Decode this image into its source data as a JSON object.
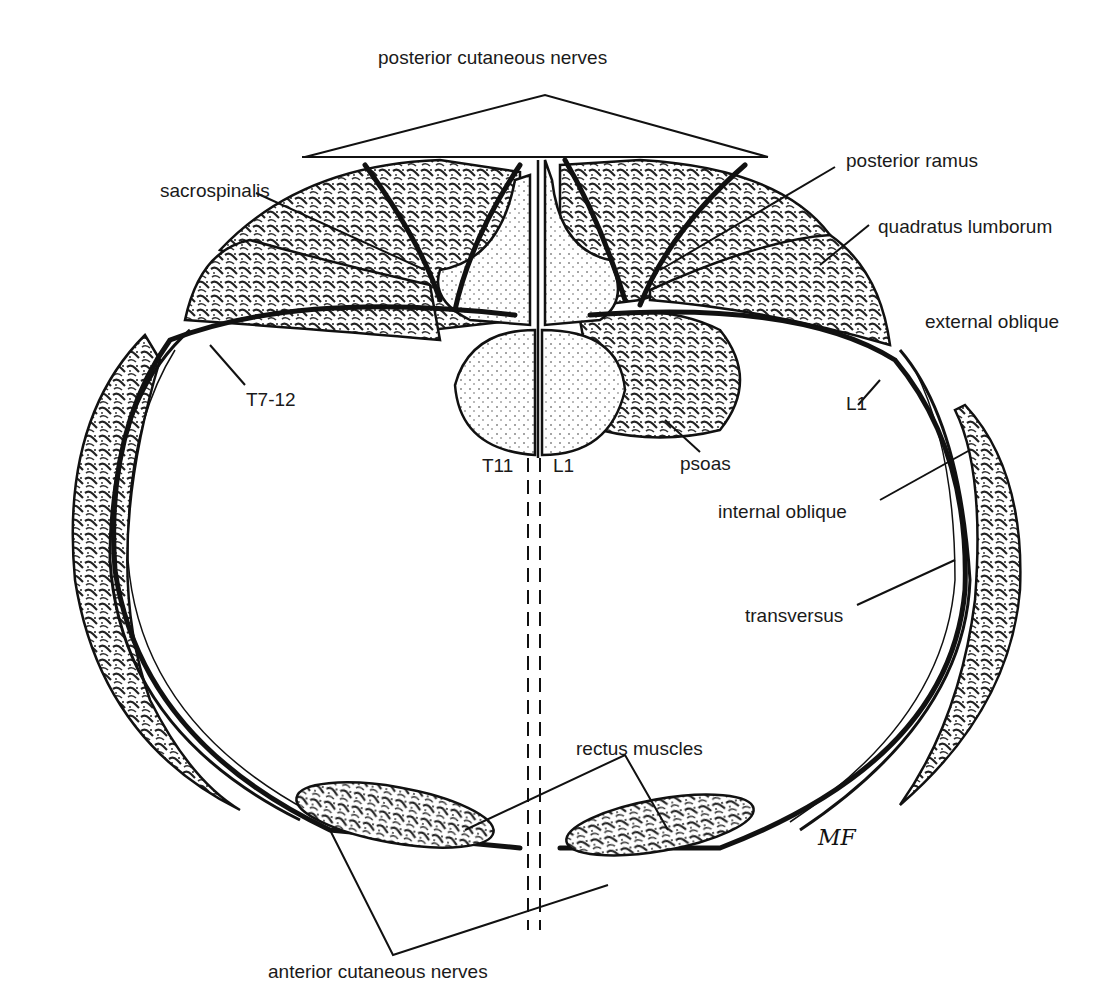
{
  "figure": {
    "labels": {
      "posterior_cutaneous_nerves": "posterior cutaneous nerves",
      "sacrospinalis": "sacrospinalis",
      "posterior_ramus": "posterior ramus",
      "quadratus_lumborum": "quadratus lumborum",
      "external_oblique": "external oblique",
      "t7_12": "T7-12",
      "l1_right": "L1",
      "psoas": "psoas",
      "t11": "T11",
      "l1_center": "L1",
      "internal_oblique": "internal oblique",
      "transversus": "transversus",
      "rectus_muscles": "rectus muscles",
      "anterior_cutaneous_nerves": "anterior cutaneous nerves",
      "signature": "MF"
    },
    "colors": {
      "ink": "#111111",
      "background": "#ffffff"
    }
  }
}
